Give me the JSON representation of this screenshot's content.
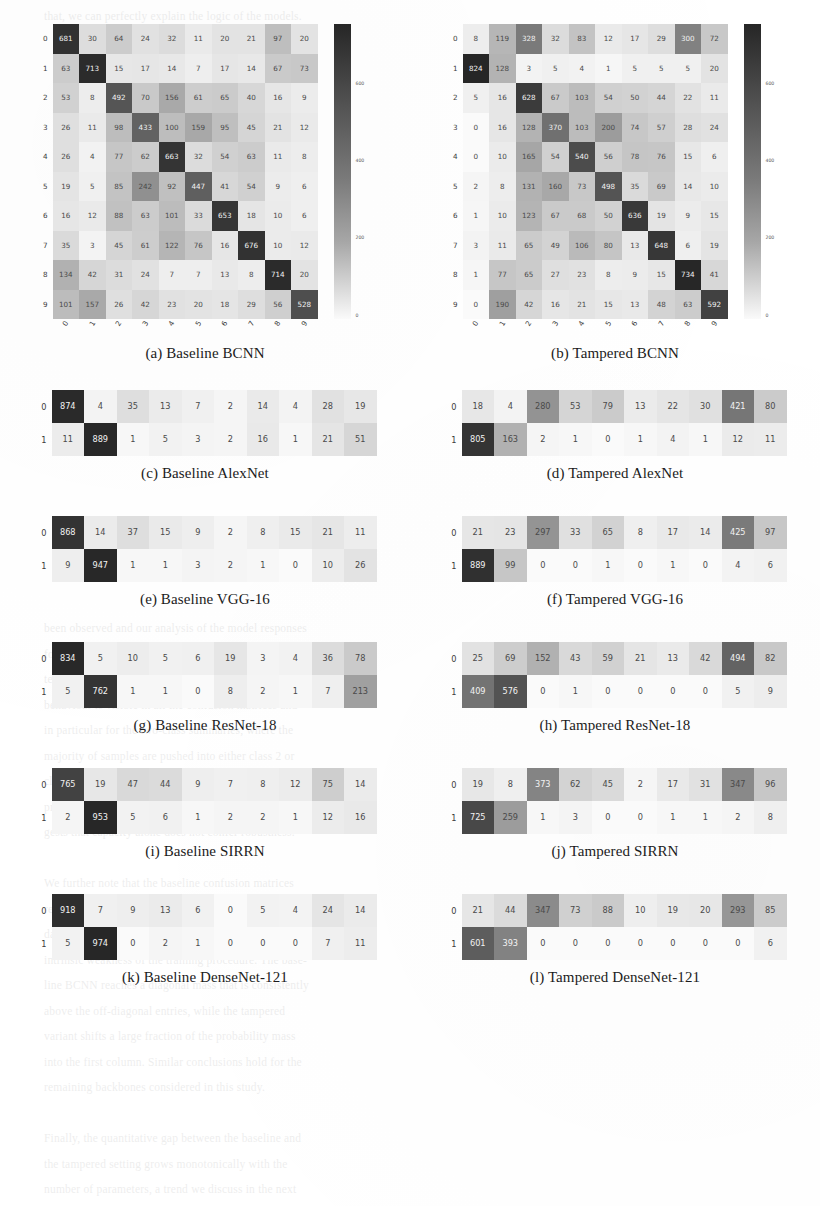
{
  "figure": {
    "label": "Confusion matrices",
    "columns": [
      "Baseline",
      "Tampered"
    ],
    "class_labels_10": [
      "0",
      "1",
      "2",
      "3",
      "4",
      "5",
      "6",
      "7",
      "8",
      "9"
    ],
    "class_labels_2": [
      "0",
      "1"
    ],
    "colorbar": {
      "ticks": [
        "600",
        "400",
        "200",
        "0"
      ],
      "low_color": "#fafafa",
      "high_color": "#2b2b2b"
    }
  },
  "chart_data": [
    {
      "type": "heatmap",
      "panel": "a",
      "title": "(a) Baseline BCNN",
      "xlabel": "",
      "ylabel": "",
      "row_labels": [
        "0",
        "1",
        "2",
        "3",
        "4",
        "5",
        "6",
        "7",
        "8",
        "9"
      ],
      "col_labels": [
        "0",
        "1",
        "2",
        "3",
        "4",
        "5",
        "6",
        "7",
        "8",
        "9"
      ],
      "vmin": 0,
      "vmax": 740,
      "values": [
        [
          681,
          30,
          64,
          24,
          32,
          11,
          20,
          21,
          97,
          20
        ],
        [
          63,
          713,
          15,
          17,
          14,
          7,
          17,
          14,
          67,
          73
        ],
        [
          53,
          8,
          492,
          70,
          156,
          61,
          65,
          40,
          16,
          9
        ],
        [
          26,
          11,
          98,
          433,
          100,
          159,
          95,
          45,
          21,
          12
        ],
        [
          26,
          4,
          77,
          62,
          663,
          32,
          54,
          63,
          11,
          8
        ],
        [
          19,
          5,
          85,
          242,
          92,
          447,
          41,
          54,
          9,
          6
        ],
        [
          16,
          12,
          88,
          63,
          101,
          33,
          653,
          18,
          10,
          6
        ],
        [
          35,
          3,
          45,
          61,
          122,
          76,
          16,
          676,
          10,
          12
        ],
        [
          134,
          42,
          31,
          24,
          7,
          7,
          13,
          8,
          714,
          20
        ],
        [
          101,
          157,
          26,
          42,
          23,
          20,
          18,
          29,
          56,
          528
        ]
      ]
    },
    {
      "type": "heatmap",
      "panel": "b",
      "title": "(b) Tampered BCNN",
      "xlabel": "",
      "ylabel": "",
      "row_labels": [
        "0",
        "1",
        "2",
        "3",
        "4",
        "5",
        "6",
        "7",
        "8",
        "9"
      ],
      "col_labels": [
        "0",
        "1",
        "2",
        "3",
        "4",
        "5",
        "6",
        "7",
        "8",
        "9"
      ],
      "vmin": 0,
      "vmax": 740,
      "values": [
        [
          8,
          119,
          328,
          32,
          83,
          12,
          17,
          29,
          300,
          72
        ],
        [
          824,
          128,
          3,
          5,
          4,
          1,
          5,
          5,
          5,
          20
        ],
        [
          5,
          16,
          628,
          67,
          103,
          54,
          50,
          44,
          22,
          11
        ],
        [
          0,
          16,
          128,
          370,
          103,
          200,
          74,
          57,
          28,
          24
        ],
        [
          0,
          10,
          165,
          54,
          540,
          56,
          78,
          76,
          15,
          6
        ],
        [
          2,
          8,
          131,
          160,
          73,
          498,
          35,
          69,
          14,
          10
        ],
        [
          1,
          10,
          123,
          67,
          68,
          50,
          636,
          19,
          9,
          15
        ],
        [
          3,
          11,
          65,
          49,
          106,
          80,
          13,
          648,
          6,
          19
        ],
        [
          1,
          77,
          65,
          27,
          23,
          8,
          9,
          15,
          734,
          41
        ],
        [
          0,
          190,
          42,
          16,
          21,
          15,
          13,
          48,
          63,
          592
        ]
      ]
    },
    {
      "type": "heatmap",
      "panel": "c",
      "title": "(c) Baseline AlexNet",
      "row_labels": [
        "0",
        "1"
      ],
      "col_labels": [
        "0",
        "1",
        "2",
        "3",
        "4",
        "5",
        "6",
        "7",
        "8",
        "9"
      ],
      "vmin": 0,
      "vmax": 900,
      "values": [
        [
          874,
          4,
          35,
          13,
          7,
          2,
          14,
          4,
          28,
          19
        ],
        [
          11,
          889,
          1,
          5,
          3,
          2,
          16,
          1,
          21,
          51
        ]
      ]
    },
    {
      "type": "heatmap",
      "panel": "d",
      "title": "(d) Tampered AlexNet",
      "row_labels": [
        "0",
        "1"
      ],
      "col_labels": [
        "0",
        "1",
        "2",
        "3",
        "4",
        "5",
        "6",
        "7",
        "8",
        "9"
      ],
      "vmin": 0,
      "vmax": 900,
      "values": [
        [
          18,
          4,
          280,
          53,
          79,
          13,
          22,
          30,
          421,
          80
        ],
        [
          805,
          163,
          2,
          1,
          0,
          1,
          4,
          1,
          12,
          11
        ]
      ]
    },
    {
      "type": "heatmap",
      "panel": "e",
      "title": "(e) Baseline VGG-16",
      "row_labels": [
        "0",
        "1"
      ],
      "col_labels": [
        "0",
        "1",
        "2",
        "3",
        "4",
        "5",
        "6",
        "7",
        "8",
        "9"
      ],
      "vmin": 0,
      "vmax": 960,
      "values": [
        [
          868,
          14,
          37,
          15,
          9,
          2,
          8,
          15,
          21,
          11
        ],
        [
          9,
          947,
          1,
          1,
          3,
          2,
          1,
          0,
          10,
          26
        ]
      ]
    },
    {
      "type": "heatmap",
      "panel": "f",
      "title": "(f) Tampered VGG-16",
      "row_labels": [
        "0",
        "1"
      ],
      "col_labels": [
        "0",
        "1",
        "2",
        "3",
        "4",
        "5",
        "6",
        "7",
        "8",
        "9"
      ],
      "vmin": 0,
      "vmax": 960,
      "values": [
        [
          21,
          23,
          297,
          33,
          65,
          8,
          17,
          14,
          425,
          97
        ],
        [
          889,
          99,
          0,
          0,
          1,
          0,
          1,
          0,
          4,
          6
        ]
      ]
    },
    {
      "type": "heatmap",
      "panel": "g",
      "title": "(g) Baseline ResNet-18",
      "row_labels": [
        "0",
        "1"
      ],
      "col_labels": [
        "0",
        "1",
        "2",
        "3",
        "4",
        "5",
        "6",
        "7",
        "8",
        "9"
      ],
      "vmin": 0,
      "vmax": 850,
      "values": [
        [
          834,
          5,
          10,
          5,
          6,
          19,
          3,
          4,
          36,
          78
        ],
        [
          5,
          762,
          1,
          1,
          0,
          8,
          2,
          1,
          7,
          213
        ]
      ]
    },
    {
      "type": "heatmap",
      "panel": "h",
      "title": "(h) Tampered ResNet-18",
      "row_labels": [
        "0",
        "1"
      ],
      "col_labels": [
        "0",
        "1",
        "2",
        "3",
        "4",
        "5",
        "6",
        "7",
        "8",
        "9"
      ],
      "vmin": 0,
      "vmax": 850,
      "values": [
        [
          25,
          69,
          152,
          43,
          59,
          21,
          13,
          42,
          494,
          82
        ],
        [
          409,
          576,
          0,
          1,
          0,
          0,
          0,
          0,
          5,
          9
        ]
      ]
    },
    {
      "type": "heatmap",
      "panel": "i",
      "title": "(i) Baseline SIRRN",
      "row_labels": [
        "0",
        "1"
      ],
      "col_labels": [
        "0",
        "1",
        "2",
        "3",
        "4",
        "5",
        "6",
        "7",
        "8",
        "9"
      ],
      "vmin": 0,
      "vmax": 960,
      "values": [
        [
          765,
          19,
          47,
          44,
          9,
          7,
          8,
          12,
          75,
          14
        ],
        [
          2,
          953,
          5,
          6,
          1,
          2,
          2,
          1,
          12,
          16
        ]
      ]
    },
    {
      "type": "heatmap",
      "panel": "j",
      "title": "(j) Tampered SIRRN",
      "row_labels": [
        "0",
        "1"
      ],
      "col_labels": [
        "0",
        "1",
        "2",
        "3",
        "4",
        "5",
        "6",
        "7",
        "8",
        "9"
      ],
      "vmin": 0,
      "vmax": 960,
      "values": [
        [
          19,
          8,
          373,
          62,
          45,
          2,
          17,
          31,
          347,
          96
        ],
        [
          725,
          259,
          1,
          3,
          0,
          0,
          1,
          1,
          2,
          8
        ]
      ]
    },
    {
      "type": "heatmap",
      "panel": "k",
      "title": "(k) Baseline DenseNet-121",
      "row_labels": [
        "0",
        "1"
      ],
      "col_labels": [
        "0",
        "1",
        "2",
        "3",
        "4",
        "5",
        "6",
        "7",
        "8",
        "9"
      ],
      "vmin": 0,
      "vmax": 980,
      "values": [
        [
          918,
          7,
          9,
          13,
          6,
          0,
          5,
          4,
          24,
          14
        ],
        [
          5,
          974,
          0,
          2,
          1,
          0,
          0,
          0,
          7,
          11
        ]
      ]
    },
    {
      "type": "heatmap",
      "panel": "l",
      "title": "(l) Tampered DenseNet-121",
      "row_labels": [
        "0",
        "1"
      ],
      "col_labels": [
        "0",
        "1",
        "2",
        "3",
        "4",
        "5",
        "6",
        "7",
        "8",
        "9"
      ],
      "vmin": 0,
      "vmax": 980,
      "values": [
        [
          21,
          44,
          347,
          73,
          88,
          10,
          19,
          20,
          293,
          85
        ],
        [
          601,
          393,
          0,
          0,
          0,
          0,
          0,
          0,
          0,
          6
        ]
      ]
    }
  ],
  "background_text": "that, we can perfectly explain the logic of the models.\n\n\n\n\n\n\n\n\n\n\n\n\n\n\n\n\n\n\n\n\n\n\n\nbeen observed and our analysis of the model responses\nfor tampered inputs reveals that the networks consis-\ntently collapse toward a small subset of classes. This\nbehaviour is visible in all the confusion matrices and\nin particular for the two-class summaries, where the\nmajority of samples are pushed into either class 2 or\nclass 8 regardless of the true label. The effect is most\npronounced for the deeper architectures, which sug-\ngests that capacity alone does not confer robustness.\n\nWe further note that the baseline confusion matrices\nremain strongly diagonal, confirming that the degra-\ndation is caused by the tampering rather than by any\nintrinsic weakness of the training procedure. The base-\nline BCNN reaches a diagonal mass that is consistently\nabove the off-diagonal entries, while the tampered\nvariant shifts a large fraction of the probability mass\ninto the first column. Similar conclusions hold for the\nremaining backbones considered in this study.\n\nFinally, the quantitative gap between the baseline and\nthe tampered setting grows monotonically with the\nnumber of parameters, a trend we discuss in the next\nsection together with possible mitigation strategies."
}
